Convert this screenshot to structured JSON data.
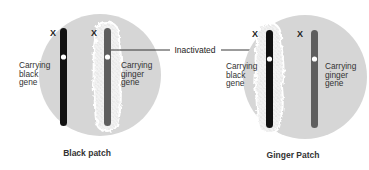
{
  "diagram": {
    "colors": {
      "cell": "#d6d6d6",
      "black_chromosome": "#111111",
      "ginger_chromosome": "#5e5e5e",
      "inactivation_halo": "#f4f4f4",
      "text": "#333333"
    },
    "callout": {
      "label": "Inactivated"
    },
    "cells": [
      {
        "caption": "Black patch",
        "chromosomes": [
          {
            "x_label": "X",
            "gene_label_lines": [
              "Carrying",
              "black",
              "gene"
            ],
            "type": "black",
            "inactivated": false
          },
          {
            "x_label": "X",
            "gene_label_lines": [
              "Carrying",
              "ginger",
              "gene"
            ],
            "type": "ginger",
            "inactivated": true
          }
        ]
      },
      {
        "caption": "Ginger Patch",
        "chromosomes": [
          {
            "x_label": "X",
            "gene_label_lines": [
              "Carrying",
              "black",
              "gene"
            ],
            "type": "black",
            "inactivated": true
          },
          {
            "x_label": "X",
            "gene_label_lines": [
              "Carrying",
              "ginger",
              "gene"
            ],
            "type": "ginger",
            "inactivated": false
          }
        ]
      }
    ]
  }
}
